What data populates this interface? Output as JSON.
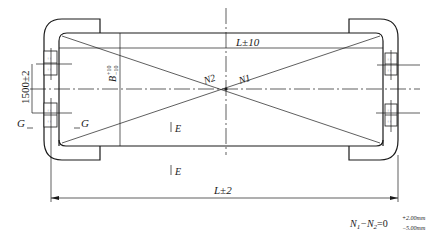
{
  "figure": {
    "type": "technical-drawing"
  },
  "labels": {
    "top_length": "L±10",
    "bottom_length": "L±2",
    "height_left": "1500±2",
    "width_b": "B",
    "width_b_tol_upper": "+10",
    "width_b_tol_lower": "−10",
    "diag_n1": "N1",
    "diag_n2": "N2",
    "section_g_left": "G",
    "section_g_right": "G",
    "section_e_top": "E",
    "section_e_bottom": "E",
    "formula_lhs": "N",
    "formula_sub1": "1",
    "formula_minus": "−N",
    "formula_sub2": "2",
    "formula_eq": "=0",
    "formula_tol_upper": "+2.00mm",
    "formula_tol_lower": "−5.00mm"
  },
  "colors": {
    "line": "#1a1a1a",
    "background": "#ffffff"
  }
}
